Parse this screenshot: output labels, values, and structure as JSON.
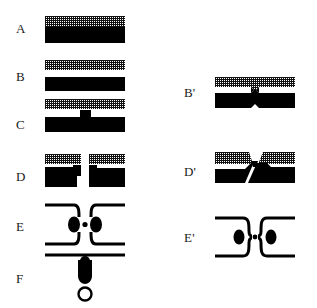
{
  "figure": {
    "width": 317,
    "height": 308,
    "background": "#ffffff",
    "ink_color": "#000000",
    "label_color": "#1a1a1a",
    "type": "scientific-process-diagram",
    "left_column_labels": [
      "A",
      "B",
      "C",
      "D",
      "E",
      "F"
    ],
    "right_column_labels": [
      "B'",
      "D'",
      "E'"
    ]
  },
  "panels": [
    {
      "id": "A",
      "label": "A",
      "label_x": 16,
      "label_y": 28,
      "x": 45,
      "y": 16,
      "width": 80,
      "height": 27,
      "kind": "stacked-bilayer",
      "layers": [
        "hatched-film",
        "solid-substrate"
      ],
      "gap": 0
    },
    {
      "id": "B",
      "label": "B",
      "label_x": 16,
      "label_y": 76,
      "x": 45,
      "y": 60,
      "width": 80,
      "height": 31,
      "kind": "separated-bilayer",
      "layers": [
        "hatched-film",
        "solid-substrate"
      ],
      "gap": 7
    },
    {
      "id": "C",
      "label": "C",
      "label_x": 16,
      "label_y": 124,
      "x": 45,
      "y": 99,
      "width": 80,
      "height": 33,
      "kind": "separated-bilayer-with-pillar",
      "layers": [
        "hatched-film",
        "solid-substrate"
      ],
      "gap": 7,
      "feature": "central-solid-pillar"
    },
    {
      "id": "D",
      "label": "D",
      "label_x": 16,
      "label_y": 176,
      "x": 45,
      "y": 154,
      "width": 80,
      "height": 34,
      "kind": "split-bilayer",
      "layers": [
        "hatched-film",
        "solid-substrate"
      ],
      "feature": "central-vertical-cleft-with-step-edges"
    },
    {
      "id": "E",
      "label": "E",
      "label_x": 16,
      "label_y": 226,
      "x": 45,
      "y": 201,
      "width": 80,
      "height": 46,
      "kind": "constricted-channel",
      "feature": "necked-outline-with-two-ellipses-and-center-dot"
    },
    {
      "id": "F",
      "label": "F",
      "label_x": 16,
      "label_y": 278,
      "x": 45,
      "y": 252,
      "width": 80,
      "height": 48,
      "kind": "detachment",
      "feature": "flat-line-above-droplet-and-open-circle"
    },
    {
      "id": "Bp",
      "label": "B'",
      "label_x": 184,
      "label_y": 92,
      "x": 215,
      "y": 77,
      "width": 80,
      "height": 32,
      "kind": "pinched-bilayer",
      "layers": [
        "hatched-film",
        "solid-substrate"
      ],
      "feature": "central-bowtie-pinch"
    },
    {
      "id": "Dp",
      "label": "D'",
      "label_x": 184,
      "label_y": 171,
      "x": 215,
      "y": 150,
      "width": 80,
      "height": 34,
      "kind": "collapsed-split-bilayer",
      "layers": [
        "hatched-film",
        "solid-substrate"
      ],
      "feature": "tilted-flaps-over-merged-substrate-with-crack"
    },
    {
      "id": "Ep",
      "label": "E'",
      "label_x": 184,
      "label_y": 237,
      "x": 215,
      "y": 214,
      "width": 80,
      "height": 45,
      "kind": "closed-constriction",
      "feature": "narrow-neck-outline-with-two-ellipses-and-center-dot"
    }
  ]
}
